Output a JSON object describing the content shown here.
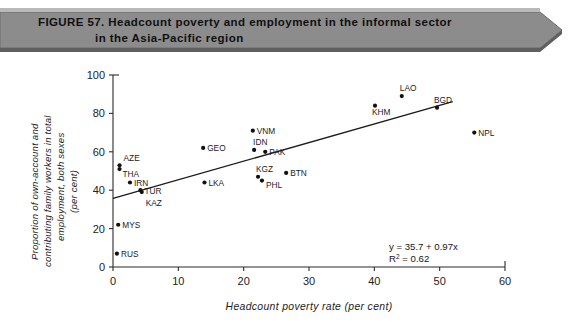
{
  "figure": {
    "number_label": "FIGURE 57.",
    "title_line1": "Headcount poverty and employment in the informal sector",
    "title_line2": "in the Asia-Pacific region",
    "banner_fill": "#8c8c8c",
    "banner_shadow": "#5f5f5f"
  },
  "chart_data": {
    "type": "scatter",
    "title": "Headcount poverty and employment in the informal sector in the Asia-Pacific region",
    "xlabel": "Headcount poverty rate (per cent)",
    "ylabel": "Proportion of own-account and contributing family workers in total employment, both sexes (per cent)",
    "ylabel_lines": [
      "Proportion of own-account and",
      "contributing family workers in total",
      "employment, both sexes",
      "(per cent)"
    ],
    "xlim": [
      0,
      60
    ],
    "ylim": [
      0,
      100
    ],
    "xticks": [
      0,
      10,
      20,
      30,
      40,
      50,
      60
    ],
    "yticks": [
      0,
      20,
      40,
      60,
      80,
      100
    ],
    "grid": false,
    "legend": "none",
    "marker_color": "#111111",
    "points": [
      {
        "label": "RUS",
        "x": 0.6,
        "y": 7,
        "label_dx": 4,
        "label_dy": 3
      },
      {
        "label": "MYS",
        "x": 0.8,
        "y": 22,
        "label_dx": 4,
        "label_dy": 3
      },
      {
        "label": "AZE",
        "x": 1.0,
        "y": 53,
        "label_dx": 4,
        "label_dy": -4
      },
      {
        "label": "THA",
        "x": 1.0,
        "y": 51,
        "label_dx": 3,
        "label_dy": 8
      },
      {
        "label": "IRN",
        "x": 2.6,
        "y": 44,
        "label_dx": 4,
        "label_dy": 3
      },
      {
        "label": "TUR",
        "x": 4.2,
        "y": 40,
        "label_dx": 4,
        "label_dy": 4
      },
      {
        "label": "KAZ",
        "x": 4.4,
        "y": 39,
        "label_dx": 4,
        "label_dy": 14
      },
      {
        "label": "LKA",
        "x": 14.0,
        "y": 44,
        "label_dx": 4,
        "label_dy": 3
      },
      {
        "label": "GEO",
        "x": 13.8,
        "y": 62,
        "label_dx": 4,
        "label_dy": 3
      },
      {
        "label": "VNM",
        "x": 21.4,
        "y": 71,
        "label_dx": 4,
        "label_dy": 3
      },
      {
        "label": "IDN",
        "x": 21.6,
        "y": 61,
        "label_dx": -1,
        "label_dy": -5
      },
      {
        "label": "PAK",
        "x": 23.3,
        "y": 60,
        "label_dx": 4,
        "label_dy": 3
      },
      {
        "label": "KGZ",
        "x": 22.2,
        "y": 47,
        "label_dx": -2,
        "label_dy": -5
      },
      {
        "label": "PHL",
        "x": 22.8,
        "y": 45,
        "label_dx": 4,
        "label_dy": 7
      },
      {
        "label": "BTN",
        "x": 26.5,
        "y": 49,
        "label_dx": 4,
        "label_dy": 3
      },
      {
        "label": "KHM",
        "x": 40.1,
        "y": 84,
        "label_dx": -3,
        "label_dy": 9
      },
      {
        "label": "LAO",
        "x": 44.2,
        "y": 89,
        "label_dx": -2,
        "label_dy": -5
      },
      {
        "label": "BGD",
        "x": 49.6,
        "y": 83,
        "label_dx": -3,
        "label_dy": -5
      },
      {
        "label": "NPL",
        "x": 55.3,
        "y": 70,
        "label_dx": 4,
        "label_dy": 3
      }
    ],
    "trendline": {
      "slope": 0.97,
      "intercept": 35.7,
      "x_start": 0,
      "x_end": 52,
      "equation": "y = 35.7 + 0.97x",
      "r_squared_label": "R",
      "r_squared_sup": "2",
      "r_squared_value": " = 0.62"
    }
  }
}
